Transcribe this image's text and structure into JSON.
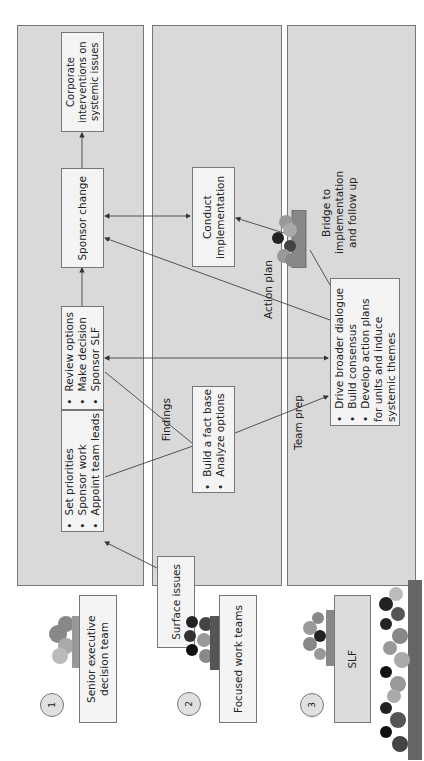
{
  "colors": {
    "panel": "#d9d9d9",
    "box": "#f4f4f4",
    "border": "#777777",
    "line": "#444444"
  },
  "groups": [
    {
      "number": "1",
      "title": "Senior executive decision team"
    },
    {
      "number": "2",
      "title": "Focused work teams"
    },
    {
      "number": "3",
      "title": "SLF"
    }
  ],
  "panel1": {
    "box_priorities": [
      "Set priorities",
      "Sponsor work",
      "Appoint team leads"
    ],
    "box_review": [
      "Review options",
      "Make decision",
      "Sponsor SLF"
    ],
    "box_sponsor": "Sponsor change",
    "box_corporate": "Corporate interventions on systemic issues"
  },
  "panel2": {
    "box_surface": "Surface issues",
    "box_factbase": [
      "Build a fact base",
      "Analyze options"
    ],
    "box_conduct": "Conduct implementation"
  },
  "panel3": {
    "box_drive": [
      "Drive broader dialogue",
      "Build consensus",
      "Develop action plans for units and induce systemic themes"
    ],
    "bridge": "Bridge to implementation and follow up"
  },
  "edge_labels": {
    "findings": "Findings",
    "team_prep": "Team prep",
    "action_plan": "Action plan"
  },
  "icons": [
    "people-group-icon",
    "numbered-circle-icon"
  ]
}
